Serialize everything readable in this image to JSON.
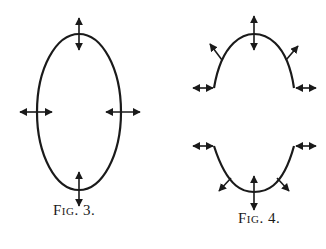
{
  "figures": [
    {
      "id": "fig3",
      "caption": "Fig. 3.",
      "shape": "closed vertical ellipse",
      "arrows": [
        "double-arrow-vertical-top",
        "double-arrow-horizontal-left",
        "double-arrow-horizontal-right",
        "double-arrow-vertical-bottom"
      ]
    },
    {
      "id": "fig4",
      "caption": "Fig. 4.",
      "shape": "ellipse split into upper and lower arches",
      "arrows": [
        "double-arrow-vertical-top",
        "outward-arrow-upper-left",
        "outward-arrow-upper-right",
        "double-arrow-horizontal-upper-left-end",
        "double-arrow-horizontal-upper-right-end",
        "double-arrow-horizontal-lower-left-end",
        "double-arrow-horizontal-lower-right-end",
        "outward-arrow-lower-left",
        "outward-arrow-lower-right",
        "double-arrow-vertical-bottom"
      ]
    }
  ],
  "colors": {
    "ink": "#1a1a1a",
    "background": "#ffffff"
  }
}
